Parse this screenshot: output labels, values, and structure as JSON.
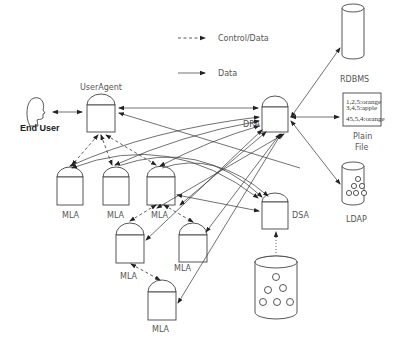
{
  "legend": {
    "control_data": "Control/Data",
    "data": "Data"
  },
  "nodes": {
    "end_user": "End User",
    "user_agent": "UserAgent",
    "dra": "DRA",
    "dsa": "DSA",
    "rdbms": "RDBMS",
    "plain_file_line1": "Plain",
    "plain_file_line2": "File",
    "ldap": "LDAP",
    "mla": [
      "MLA",
      "MLA",
      "MLA",
      "MLA",
      "MLA",
      "MLA"
    ]
  },
  "plain_file_contents": [
    "1,2,5:orange",
    "3,4,5:apple",
    "45,5,4:orange"
  ],
  "colors": {
    "stroke": "#444444",
    "background": "#ffffff"
  }
}
